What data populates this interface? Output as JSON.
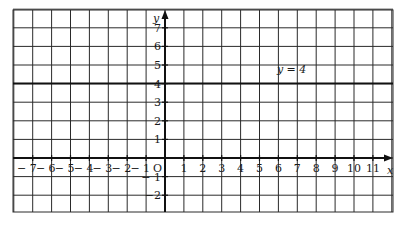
{
  "chart_data": {
    "type": "line",
    "title": "",
    "xlabel": "x",
    "ylabel": "y",
    "xlim": [
      -8,
      12
    ],
    "ylim": [
      -3,
      8
    ],
    "grid": true,
    "x_ticks": [
      -7,
      -6,
      -5,
      -4,
      -3,
      -2,
      -1,
      1,
      2,
      3,
      4,
      5,
      6,
      7,
      8,
      9,
      10,
      11
    ],
    "y_ticks": [
      7,
      6,
      5,
      4,
      3,
      2,
      1,
      -1,
      -2
    ],
    "x_tick_labels": [
      "− 7",
      "− 6",
      "− 5",
      "− 4",
      "− 3",
      "− 2",
      "− 1",
      "1",
      "2",
      "3",
      "4",
      "5",
      "6",
      "7",
      "8",
      "9",
      "10",
      "11"
    ],
    "y_tick_labels": [
      "7",
      "6",
      "5",
      "4",
      "3",
      "2",
      "1",
      "− 1",
      "−2"
    ],
    "origin_label": "O",
    "series": [
      {
        "name": "y = 4",
        "equation": "y = 4",
        "x": [
          -8,
          12
        ],
        "y": [
          4,
          4
        ]
      }
    ],
    "annotations": [
      {
        "text": "y = 4",
        "x": 6.7,
        "y": 4.7
      }
    ]
  },
  "colors": {
    "grid": "#2a2a2a",
    "axis": "#111111",
    "line": "#111111",
    "background": "#ffffff"
  }
}
